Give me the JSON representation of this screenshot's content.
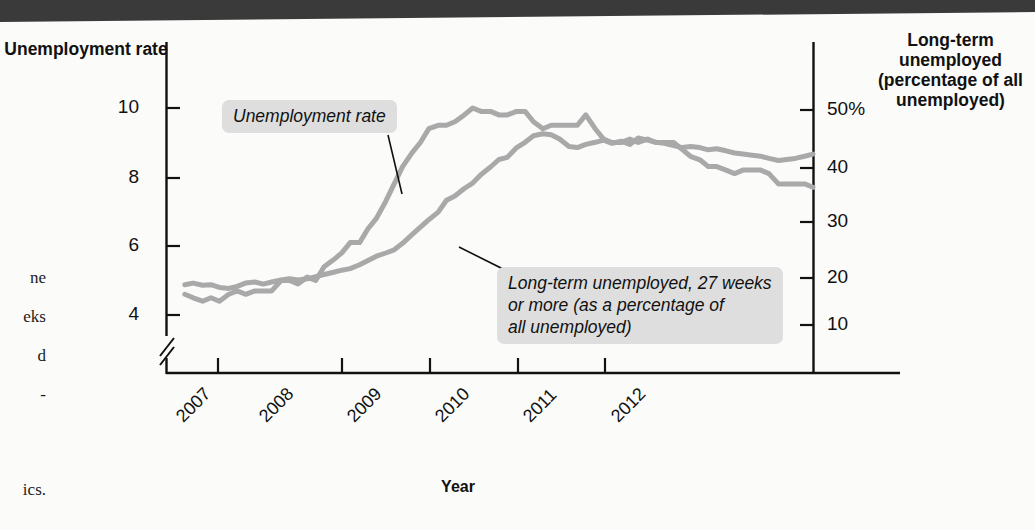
{
  "page": {
    "margin_note_lines": [
      "ne",
      "eks",
      "d",
      "-",
      "ics."
    ],
    "topbar_color": "#3a3a3a",
    "background_color": "#fbfbfa"
  },
  "chart_data": {
    "type": "line",
    "title": "",
    "xlabel": "Year",
    "left_axis": {
      "label": "Unemployment rate",
      "ticks": [
        4,
        6,
        8,
        10
      ],
      "tick_labels": [
        "4",
        "6",
        "8",
        "10"
      ],
      "ylim": [
        3.2,
        10.9
      ],
      "axis_break": true
    },
    "right_axis": {
      "label": "Long-term unemployed (percentage of all unemployed)",
      "ticks": [
        10,
        20,
        30,
        40,
        50
      ],
      "tick_labels": [
        "10",
        "20",
        "30",
        "40",
        "50%"
      ],
      "ylim": [
        5,
        54
      ]
    },
    "x": [
      "2007",
      "2008",
      "2009",
      "2010",
      "2011",
      "2012"
    ],
    "xlim": [
      2006.83,
      2013.0
    ],
    "grid": false,
    "legend_position": "inline-callouts",
    "annotations": [
      {
        "name": "unemployment-rate-callout",
        "text": "Unemployment rate",
        "points_to_series": "Unemployment rate"
      },
      {
        "name": "long-term-unemployed-callout",
        "text": "Long-term unemployed, 27 weeks or more (as a percentage of all unemployed)",
        "lines": [
          "Long-term unemployed, 27 weeks",
          "or more (as a percentage of",
          "all unemployed)"
        ],
        "points_to_series": "Long-term unemployed"
      }
    ],
    "series": [
      {
        "name": "Unemployment rate",
        "axis": "left",
        "color": "#a9a9a9",
        "unit": "percent",
        "points": [
          [
            2007.0,
            4.6
          ],
          [
            2007.08,
            4.5
          ],
          [
            2007.17,
            4.4
          ],
          [
            2007.25,
            4.5
          ],
          [
            2007.33,
            4.4
          ],
          [
            2007.42,
            4.6
          ],
          [
            2007.5,
            4.7
          ],
          [
            2007.58,
            4.6
          ],
          [
            2007.67,
            4.7
          ],
          [
            2007.75,
            4.7
          ],
          [
            2007.83,
            4.7
          ],
          [
            2007.92,
            5.0
          ],
          [
            2008.0,
            5.0
          ],
          [
            2008.08,
            4.9
          ],
          [
            2008.17,
            5.1
          ],
          [
            2008.25,
            5.0
          ],
          [
            2008.33,
            5.4
          ],
          [
            2008.42,
            5.6
          ],
          [
            2008.5,
            5.8
          ],
          [
            2008.58,
            6.1
          ],
          [
            2008.67,
            6.1
          ],
          [
            2008.75,
            6.5
          ],
          [
            2008.83,
            6.8
          ],
          [
            2008.92,
            7.3
          ],
          [
            2009.0,
            7.8
          ],
          [
            2009.08,
            8.3
          ],
          [
            2009.17,
            8.7
          ],
          [
            2009.25,
            9.0
          ],
          [
            2009.33,
            9.4
          ],
          [
            2009.42,
            9.5
          ],
          [
            2009.5,
            9.5
          ],
          [
            2009.58,
            9.6
          ],
          [
            2009.67,
            9.8
          ],
          [
            2009.75,
            10.0
          ],
          [
            2009.83,
            9.9
          ],
          [
            2009.92,
            9.9
          ],
          [
            2010.0,
            9.8
          ],
          [
            2010.08,
            9.8
          ],
          [
            2010.17,
            9.9
          ],
          [
            2010.25,
            9.9
          ],
          [
            2010.33,
            9.6
          ],
          [
            2010.42,
            9.4
          ],
          [
            2010.5,
            9.5
          ],
          [
            2010.58,
            9.5
          ],
          [
            2010.67,
            9.5
          ],
          [
            2010.75,
            9.5
          ],
          [
            2010.83,
            9.8
          ],
          [
            2010.92,
            9.4
          ],
          [
            2011.0,
            9.1
          ],
          [
            2011.08,
            9.0
          ],
          [
            2011.17,
            9.0
          ],
          [
            2011.25,
            9.1
          ],
          [
            2011.33,
            9.0
          ],
          [
            2011.42,
            9.1
          ],
          [
            2011.5,
            9.0
          ],
          [
            2011.58,
            9.0
          ],
          [
            2011.67,
            9.0
          ],
          [
            2011.75,
            8.8
          ],
          [
            2011.83,
            8.6
          ],
          [
            2011.92,
            8.5
          ],
          [
            2012.0,
            8.3
          ],
          [
            2012.08,
            8.3
          ],
          [
            2012.17,
            8.2
          ],
          [
            2012.25,
            8.1
          ],
          [
            2012.33,
            8.2
          ],
          [
            2012.42,
            8.2
          ],
          [
            2012.5,
            8.2
          ],
          [
            2012.58,
            8.1
          ],
          [
            2012.67,
            7.8
          ],
          [
            2012.75,
            7.8
          ],
          [
            2012.83,
            7.8
          ],
          [
            2012.92,
            7.8
          ],
          [
            2013.0,
            7.7
          ]
        ]
      },
      {
        "name": "Long-term unemployed",
        "axis": "right",
        "color": "#a9a9a9",
        "unit": "percent of all unemployed",
        "points": [
          [
            2007.0,
            17.5
          ],
          [
            2007.08,
            17.8
          ],
          [
            2007.17,
            17.4
          ],
          [
            2007.25,
            17.5
          ],
          [
            2007.33,
            17.0
          ],
          [
            2007.42,
            16.8
          ],
          [
            2007.5,
            17.2
          ],
          [
            2007.58,
            17.8
          ],
          [
            2007.67,
            18.0
          ],
          [
            2007.75,
            17.6
          ],
          [
            2007.83,
            18.0
          ],
          [
            2007.92,
            18.4
          ],
          [
            2008.0,
            18.6
          ],
          [
            2008.08,
            18.4
          ],
          [
            2008.17,
            18.6
          ],
          [
            2008.25,
            19.0
          ],
          [
            2008.33,
            19.4
          ],
          [
            2008.42,
            19.8
          ],
          [
            2008.5,
            20.2
          ],
          [
            2008.58,
            20.5
          ],
          [
            2008.67,
            21.2
          ],
          [
            2008.75,
            22.0
          ],
          [
            2008.83,
            22.8
          ],
          [
            2008.92,
            23.4
          ],
          [
            2009.0,
            24.0
          ],
          [
            2009.08,
            25.2
          ],
          [
            2009.17,
            26.8
          ],
          [
            2009.25,
            28.2
          ],
          [
            2009.33,
            29.6
          ],
          [
            2009.42,
            31.0
          ],
          [
            2009.5,
            33.2
          ],
          [
            2009.58,
            34.0
          ],
          [
            2009.67,
            35.4
          ],
          [
            2009.75,
            36.4
          ],
          [
            2009.83,
            38.0
          ],
          [
            2009.92,
            39.4
          ],
          [
            2010.0,
            40.8
          ],
          [
            2010.08,
            41.2
          ],
          [
            2010.17,
            43.0
          ],
          [
            2010.25,
            44.0
          ],
          [
            2010.33,
            45.2
          ],
          [
            2010.42,
            45.6
          ],
          [
            2010.5,
            45.4
          ],
          [
            2010.58,
            44.6
          ],
          [
            2010.67,
            43.2
          ],
          [
            2010.75,
            43.0
          ],
          [
            2010.83,
            43.6
          ],
          [
            2010.92,
            44.0
          ],
          [
            2011.0,
            44.4
          ],
          [
            2011.08,
            43.8
          ],
          [
            2011.17,
            44.2
          ],
          [
            2011.25,
            43.6
          ],
          [
            2011.33,
            44.8
          ],
          [
            2011.42,
            44.4
          ],
          [
            2011.5,
            44.0
          ],
          [
            2011.58,
            43.8
          ],
          [
            2011.67,
            43.4
          ],
          [
            2011.75,
            43.0
          ],
          [
            2011.83,
            43.2
          ],
          [
            2011.92,
            43.0
          ],
          [
            2012.0,
            42.6
          ],
          [
            2012.08,
            42.8
          ],
          [
            2012.17,
            42.4
          ],
          [
            2012.25,
            42.0
          ],
          [
            2012.33,
            41.8
          ],
          [
            2012.42,
            41.6
          ],
          [
            2012.5,
            41.4
          ],
          [
            2012.58,
            41.0
          ],
          [
            2012.67,
            40.6
          ],
          [
            2012.75,
            40.8
          ],
          [
            2012.83,
            41.0
          ],
          [
            2012.92,
            41.4
          ],
          [
            2013.0,
            41.8
          ]
        ]
      }
    ]
  }
}
